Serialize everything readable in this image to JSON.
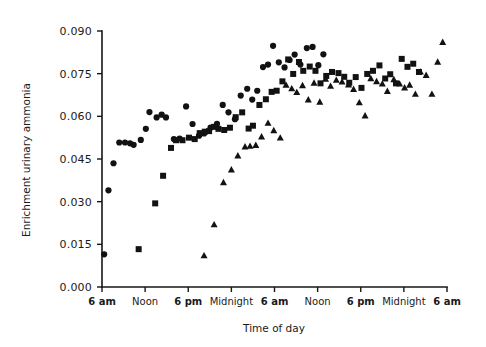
{
  "chart_data": {
    "type": "scatter",
    "title": "",
    "subtitle": "",
    "xlabel": "Time of day",
    "ylabel": "Enrichment urinary ammonia",
    "xlim": [
      0,
      48
    ],
    "ylim": [
      0.0,
      0.09
    ],
    "grid": false,
    "legend_position": "none",
    "x_tick_values": [
      0,
      6,
      12,
      18,
      24,
      30,
      36,
      42,
      48
    ],
    "x_tick_labels": [
      "6 am",
      "Noon",
      "6 pm",
      "Midnight",
      "6 am",
      "Noon",
      "6 pm",
      "Midnight",
      "6 am"
    ],
    "y_tick_values": [
      0.0,
      0.015,
      0.03,
      0.045,
      0.06,
      0.075,
      0.09
    ],
    "y_tick_labels": [
      "0.000",
      "0.015",
      "0.030",
      "0.045",
      "0.060",
      "0.075",
      "0.090"
    ],
    "series": [
      {
        "name": "Subject 1",
        "marker": "circle",
        "color": "#121212",
        "points": [
          [
            0.3,
            0.0115
          ],
          [
            0.9,
            0.034
          ],
          [
            1.6,
            0.0435
          ],
          [
            2.4,
            0.0508
          ],
          [
            3.2,
            0.0508
          ],
          [
            3.9,
            0.0505
          ],
          [
            4.4,
            0.05
          ],
          [
            5.4,
            0.0517
          ],
          [
            6.1,
            0.0556
          ],
          [
            6.6,
            0.0615
          ],
          [
            7.6,
            0.0596
          ],
          [
            8.3,
            0.0606
          ],
          [
            8.9,
            0.0596
          ],
          [
            10.0,
            0.052
          ],
          [
            10.8,
            0.0522
          ],
          [
            11.7,
            0.0635
          ],
          [
            12.6,
            0.0573
          ],
          [
            13.5,
            0.0532
          ],
          [
            14.2,
            0.054
          ],
          [
            15.1,
            0.056
          ],
          [
            16.0,
            0.0574
          ],
          [
            16.8,
            0.064
          ],
          [
            17.6,
            0.0614
          ],
          [
            18.5,
            0.059
          ],
          [
            19.3,
            0.0673
          ],
          [
            20.2,
            0.0697
          ],
          [
            20.9,
            0.0659
          ],
          [
            21.6,
            0.069
          ],
          [
            22.4,
            0.0773
          ],
          [
            23.1,
            0.0782
          ],
          [
            23.8,
            0.0848
          ],
          [
            24.6,
            0.079
          ],
          [
            25.4,
            0.0772
          ],
          [
            26.1,
            0.0798
          ],
          [
            26.8,
            0.0817
          ],
          [
            27.6,
            0.0782
          ],
          [
            28.5,
            0.084
          ],
          [
            29.3,
            0.0844
          ],
          [
            30.1,
            0.078
          ],
          [
            30.8,
            0.0818
          ]
        ]
      },
      {
        "name": "Subject 2",
        "marker": "square",
        "color": "#121212",
        "points": [
          [
            5.1,
            0.0133
          ],
          [
            7.4,
            0.0294
          ],
          [
            8.5,
            0.0391
          ],
          [
            9.6,
            0.0489
          ],
          [
            10.3,
            0.0516
          ],
          [
            11.2,
            0.0516
          ],
          [
            12.1,
            0.0525
          ],
          [
            12.9,
            0.052
          ],
          [
            13.6,
            0.0541
          ],
          [
            14.3,
            0.0546
          ],
          [
            14.9,
            0.0548
          ],
          [
            15.6,
            0.0563
          ],
          [
            16.2,
            0.0556
          ],
          [
            17.0,
            0.0552
          ],
          [
            17.8,
            0.056
          ],
          [
            18.6,
            0.0597
          ],
          [
            19.5,
            0.0614
          ],
          [
            20.4,
            0.0557
          ],
          [
            21.0,
            0.0567
          ],
          [
            21.9,
            0.064
          ],
          [
            22.8,
            0.066
          ],
          [
            23.6,
            0.0686
          ],
          [
            24.3,
            0.069
          ],
          [
            25.1,
            0.0723
          ],
          [
            25.9,
            0.08
          ],
          [
            26.6,
            0.0749
          ],
          [
            27.4,
            0.0791
          ],
          [
            28.0,
            0.076
          ],
          [
            28.9,
            0.0775
          ],
          [
            29.7,
            0.076
          ],
          [
            30.4,
            0.0716
          ],
          [
            31.2,
            0.0742
          ],
          [
            32.0,
            0.0756
          ],
          [
            32.9,
            0.0752
          ],
          [
            33.7,
            0.0739
          ],
          [
            34.4,
            0.0718
          ],
          [
            35.3,
            0.0738
          ],
          [
            36.1,
            0.07
          ],
          [
            36.9,
            0.0749
          ],
          [
            37.7,
            0.076
          ],
          [
            38.6,
            0.0779
          ],
          [
            39.4,
            0.0733
          ],
          [
            40.1,
            0.0748
          ],
          [
            40.9,
            0.0716
          ],
          [
            41.7,
            0.0802
          ],
          [
            42.5,
            0.0774
          ],
          [
            43.3,
            0.0785
          ],
          [
            44.1,
            0.0756
          ]
        ]
      },
      {
        "name": "Subject 3",
        "marker": "triangle",
        "color": "#121212",
        "points": [
          [
            14.2,
            0.0112
          ],
          [
            15.6,
            0.0221
          ],
          [
            16.9,
            0.0369
          ],
          [
            18.0,
            0.0414
          ],
          [
            18.9,
            0.0463
          ],
          [
            19.9,
            0.0495
          ],
          [
            20.6,
            0.0497
          ],
          [
            21.4,
            0.05
          ],
          [
            22.2,
            0.053
          ],
          [
            23.1,
            0.0578
          ],
          [
            23.9,
            0.0552
          ],
          [
            24.8,
            0.0526
          ],
          [
            25.6,
            0.0712
          ],
          [
            26.4,
            0.0699
          ],
          [
            27.1,
            0.0686
          ],
          [
            27.9,
            0.071
          ],
          [
            28.7,
            0.066
          ],
          [
            29.5,
            0.0719
          ],
          [
            30.3,
            0.0652
          ],
          [
            31.1,
            0.0733
          ],
          [
            31.8,
            0.0708
          ],
          [
            32.6,
            0.0729
          ],
          [
            33.4,
            0.0723
          ],
          [
            34.3,
            0.0713
          ],
          [
            35.0,
            0.0697
          ],
          [
            35.8,
            0.065
          ],
          [
            36.6,
            0.0604
          ],
          [
            37.4,
            0.0735
          ],
          [
            38.2,
            0.0724
          ],
          [
            39.0,
            0.0716
          ],
          [
            39.7,
            0.069
          ],
          [
            40.6,
            0.0731
          ],
          [
            41.4,
            0.0716
          ],
          [
            42.1,
            0.0702
          ],
          [
            42.8,
            0.0712
          ],
          [
            43.6,
            0.068
          ],
          [
            44.3,
            0.0758
          ],
          [
            45.1,
            0.0746
          ],
          [
            45.9,
            0.068
          ],
          [
            46.7,
            0.0793
          ],
          [
            47.4,
            0.0862
          ]
        ]
      }
    ]
  }
}
